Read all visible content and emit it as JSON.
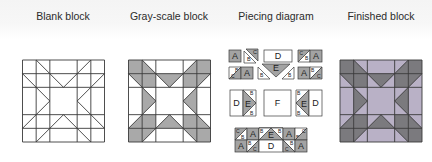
{
  "captions": {
    "blank": "Blank block",
    "grayscale": "Gray-scale block",
    "piecing": "Piecing diagram",
    "finished": "Finished block"
  },
  "colors": {
    "line": "#3a3a3a",
    "blank_fill": "#ffffff",
    "gray_dark": "#a9a9a9",
    "gray_light": "#ffffff",
    "finished_dark": "#7b7a7e",
    "finished_light": "#b9b1c6",
    "piece_dark": "#a3a3a3",
    "piece_light": "#ffffff"
  },
  "block_grid": {
    "units": 6,
    "lines": [
      0,
      1,
      2,
      4,
      5,
      6
    ],
    "diagonals": [
      [
        [
          1,
          0
        ],
        [
          3,
          2
        ]
      ],
      [
        [
          5,
          0
        ],
        [
          3,
          2
        ]
      ],
      [
        [
          0,
          1
        ],
        [
          2,
          3
        ]
      ],
      [
        [
          0,
          5
        ],
        [
          2,
          3
        ]
      ],
      [
        [
          6,
          1
        ],
        [
          4,
          3
        ]
      ],
      [
        [
          6,
          5
        ],
        [
          4,
          3
        ]
      ],
      [
        [
          1,
          6
        ],
        [
          3,
          4
        ]
      ],
      [
        [
          5,
          6
        ],
        [
          3,
          4
        ]
      ]
    ],
    "dark_shapes": [
      [
        [
          0,
          0
        ],
        [
          1,
          0
        ],
        [
          1,
          1
        ],
        [
          0,
          1
        ]
      ],
      [
        [
          5,
          0
        ],
        [
          6,
          0
        ],
        [
          6,
          1
        ],
        [
          5,
          1
        ]
      ],
      [
        [
          0,
          5
        ],
        [
          1,
          5
        ],
        [
          1,
          6
        ],
        [
          0,
          6
        ]
      ],
      [
        [
          5,
          5
        ],
        [
          6,
          5
        ],
        [
          6,
          6
        ],
        [
          5,
          6
        ]
      ],
      [
        [
          1,
          1
        ],
        [
          2,
          1
        ],
        [
          2,
          2
        ],
        [
          1,
          2
        ]
      ],
      [
        [
          4,
          1
        ],
        [
          5,
          1
        ],
        [
          5,
          2
        ],
        [
          4,
          2
        ]
      ],
      [
        [
          1,
          4
        ],
        [
          2,
          4
        ],
        [
          2,
          5
        ],
        [
          1,
          5
        ]
      ],
      [
        [
          4,
          4
        ],
        [
          5,
          4
        ],
        [
          5,
          5
        ],
        [
          4,
          5
        ]
      ],
      [
        [
          1,
          0
        ],
        [
          1,
          1
        ],
        [
          2,
          1
        ]
      ],
      [
        [
          5,
          0
        ],
        [
          5,
          1
        ],
        [
          4,
          1
        ]
      ],
      [
        [
          0,
          1
        ],
        [
          1,
          1
        ],
        [
          1,
          2
        ]
      ],
      [
        [
          6,
          1
        ],
        [
          5,
          1
        ],
        [
          5,
          2
        ]
      ],
      [
        [
          0,
          5
        ],
        [
          1,
          5
        ],
        [
          1,
          4
        ]
      ],
      [
        [
          6,
          5
        ],
        [
          5,
          5
        ],
        [
          5,
          4
        ]
      ],
      [
        [
          1,
          6
        ],
        [
          1,
          5
        ],
        [
          2,
          5
        ]
      ],
      [
        [
          5,
          6
        ],
        [
          5,
          5
        ],
        [
          4,
          5
        ]
      ],
      [
        [
          2,
          1
        ],
        [
          4,
          1
        ],
        [
          3,
          2
        ]
      ],
      [
        [
          2,
          5
        ],
        [
          4,
          5
        ],
        [
          3,
          4
        ]
      ],
      [
        [
          1,
          2
        ],
        [
          1,
          4
        ],
        [
          2,
          3
        ]
      ],
      [
        [
          5,
          2
        ],
        [
          5,
          4
        ],
        [
          4,
          3
        ]
      ]
    ]
  },
  "blocks": {
    "blank": {
      "x": 22.5,
      "y": 60,
      "size": 82
    },
    "grayscale": {
      "x": 128.5,
      "y": 60,
      "size": 82
    },
    "finished": {
      "x": 340,
      "y": 60,
      "size": 82
    }
  },
  "piecing": {
    "pieces": [
      {
        "shape": "rect",
        "x": 229,
        "y": 50,
        "w": 12,
        "h": 12,
        "fill": "dark",
        "label": "A"
      },
      {
        "shape": "poly",
        "pts": [
          [
            244,
            51
          ],
          [
            244,
            63
          ],
          [
            256,
            63
          ]
        ],
        "fill": "light",
        "label": "B",
        "lx": 247,
        "ly": 61,
        "fs": 5.5
      },
      {
        "shape": "poly",
        "pts": [
          [
            246,
            49
          ],
          [
            258,
            49
          ],
          [
            258,
            61
          ]
        ],
        "fill": "dark",
        "label": "C",
        "lx": 253,
        "ly": 54,
        "fs": 5.5
      },
      {
        "shape": "rect",
        "x": 264,
        "y": 50,
        "w": 28,
        "h": 12,
        "fill": "light",
        "label": "D"
      },
      {
        "shape": "poly",
        "pts": [
          [
            298,
            50
          ],
          [
            310,
            50
          ],
          [
            298,
            62
          ]
        ],
        "fill": "dark",
        "label": "C",
        "lx": 299.5,
        "ly": 55,
        "fs": 5
      },
      {
        "shape": "poly",
        "pts": [
          [
            310,
            50
          ],
          [
            310,
            62
          ],
          [
            298,
            62
          ]
        ],
        "fill": "light",
        "label": "B",
        "lx": 305,
        "ly": 60,
        "fs": 5
      },
      {
        "shape": "rect",
        "x": 310,
        "y": 50,
        "w": 12,
        "h": 12,
        "fill": "dark",
        "label": "A"
      },
      {
        "shape": "poly",
        "pts": [
          [
            229,
            67
          ],
          [
            241,
            67
          ],
          [
            229,
            79
          ]
        ],
        "fill": "light",
        "label": "B",
        "lx": 235,
        "ly": 72,
        "fs": 5
      },
      {
        "shape": "poly",
        "pts": [
          [
            241,
            67
          ],
          [
            241,
            79
          ],
          [
            229,
            79
          ]
        ],
        "fill": "dark",
        "label": "C",
        "lx": 231,
        "ly": 78,
        "fs": 5
      },
      {
        "shape": "rect",
        "x": 241,
        "y": 67,
        "w": 12,
        "h": 12,
        "fill": "dark",
        "label": "A"
      },
      {
        "shape": "poly",
        "pts": [
          [
            262,
            64
          ],
          [
            290,
            64
          ],
          [
            276,
            77
          ]
        ],
        "fill": "dark",
        "label": "E"
      },
      {
        "shape": "poly",
        "pts": [
          [
            258,
            67
          ],
          [
            258,
            79
          ],
          [
            270,
            79
          ]
        ],
        "fill": "light",
        "label": "B",
        "lx": 260,
        "ly": 77,
        "fs": 5
      },
      {
        "shape": "poly",
        "pts": [
          [
            294,
            67
          ],
          [
            294,
            79
          ],
          [
            282,
            79
          ]
        ],
        "fill": "light",
        "label": "B",
        "lx": 288,
        "ly": 77,
        "fs": 5
      },
      {
        "shape": "rect",
        "x": 298,
        "y": 67,
        "w": 12,
        "h": 12,
        "fill": "dark",
        "label": "A"
      },
      {
        "shape": "poly",
        "pts": [
          [
            310,
            67
          ],
          [
            322,
            67
          ],
          [
            310,
            79
          ]
        ],
        "fill": "light",
        "label": "B",
        "lx": 311,
        "ly": 72,
        "fs": 5
      },
      {
        "shape": "poly",
        "pts": [
          [
            322,
            67
          ],
          [
            322,
            79
          ],
          [
            310,
            79
          ]
        ],
        "fill": "dark",
        "label": "C",
        "lx": 317,
        "ly": 78,
        "fs": 5
      },
      {
        "shape": "rect",
        "x": 230,
        "y": 90,
        "w": 13,
        "h": 26,
        "fill": "light",
        "label": "D"
      },
      {
        "shape": "poly",
        "pts": [
          [
            243,
            90
          ],
          [
            243,
            116
          ],
          [
            256,
            103
          ]
        ],
        "fill": "dark",
        "label": "E",
        "lx": 245,
        "ly": 106.5
      },
      {
        "shape": "poly",
        "pts": [
          [
            243,
            90
          ],
          [
            256,
            90
          ],
          [
            256,
            103
          ]
        ],
        "fill": "light",
        "label": "B",
        "lx": 250,
        "ly": 95,
        "fs": 5
      },
      {
        "shape": "poly",
        "pts": [
          [
            243,
            116
          ],
          [
            256,
            116
          ],
          [
            256,
            103
          ]
        ],
        "fill": "light",
        "label": "B",
        "lx": 250,
        "ly": 115,
        "fs": 5
      },
      {
        "shape": "rect",
        "x": 264,
        "y": 90,
        "w": 27,
        "h": 26,
        "fill": "light",
        "label": "F"
      },
      {
        "shape": "poly",
        "pts": [
          [
            309,
            90
          ],
          [
            309,
            116
          ],
          [
            296,
            103
          ]
        ],
        "fill": "dark",
        "label": "E",
        "lx": 301,
        "ly": 106.5
      },
      {
        "shape": "poly",
        "pts": [
          [
            296,
            90
          ],
          [
            309,
            90
          ],
          [
            296,
            103
          ]
        ],
        "fill": "light",
        "label": "B",
        "lx": 297,
        "ly": 95,
        "fs": 5
      },
      {
        "shape": "poly",
        "pts": [
          [
            296,
            116
          ],
          [
            309,
            116
          ],
          [
            296,
            103
          ]
        ],
        "fill": "light",
        "label": "B",
        "lx": 297,
        "ly": 115,
        "fs": 5
      },
      {
        "shape": "rect",
        "x": 309,
        "y": 90,
        "w": 13,
        "h": 26,
        "fill": "light",
        "label": "D"
      },
      {
        "shape": "poly",
        "pts": [
          [
            235,
            128
          ],
          [
            247,
            128
          ],
          [
            235,
            140
          ]
        ],
        "fill": "dark",
        "label": "C",
        "lx": 236,
        "ly": 133,
        "fs": 5
      },
      {
        "shape": "poly",
        "pts": [
          [
            247,
            128
          ],
          [
            247,
            140
          ],
          [
            235,
            140
          ]
        ],
        "fill": "light",
        "label": "B",
        "lx": 241,
        "ly": 139,
        "fs": 5
      },
      {
        "shape": "rect",
        "x": 247,
        "y": 128,
        "w": 12,
        "h": 12,
        "fill": "dark",
        "label": "A"
      },
      {
        "shape": "poly",
        "pts": [
          [
            259,
            128
          ],
          [
            259,
            140
          ],
          [
            271,
            140
          ]
        ],
        "fill": "light",
        "label": "B",
        "lx": 260,
        "ly": 134,
        "fs": 5
      },
      {
        "shape": "poly",
        "pts": [
          [
            259,
            128
          ],
          [
            271,
            140
          ],
          [
            283,
            128
          ],
          [
            271,
            128
          ]
        ],
        "fill": "light"
      },
      {
        "shape": "poly",
        "pts": [
          [
            259,
            128
          ],
          [
            283,
            128
          ],
          [
            271,
            140
          ]
        ],
        "fill": "light"
      },
      {
        "shape": "poly",
        "pts": [
          [
            271,
            128
          ],
          [
            259,
            140
          ],
          [
            283,
            140
          ]
        ],
        "fill": "dark",
        "label": "E",
        "lx": 268,
        "ly": 138
      },
      {
        "shape": "poly",
        "pts": [
          [
            259,
            128
          ],
          [
            271,
            128
          ],
          [
            259,
            140
          ]
        ],
        "fill": "light",
        "label": "B",
        "lx": 260,
        "ly": 133,
        "fs": 5
      },
      {
        "shape": "poly",
        "pts": [
          [
            271,
            128
          ],
          [
            283,
            128
          ],
          [
            283,
            140
          ]
        ],
        "fill": "light",
        "label": "B",
        "lx": 278,
        "ly": 133,
        "fs": 5
      },
      {
        "shape": "rect",
        "x": 283,
        "y": 128,
        "w": 12,
        "h": 12,
        "fill": "dark",
        "label": "A"
      },
      {
        "shape": "poly",
        "pts": [
          [
            295,
            128
          ],
          [
            307,
            128
          ],
          [
            295,
            140
          ]
        ],
        "fill": "light",
        "label": "B",
        "lx": 296,
        "ly": 139,
        "fs": 5
      },
      {
        "shape": "poly",
        "pts": [
          [
            307,
            128
          ],
          [
            307,
            140
          ],
          [
            295,
            140
          ]
        ],
        "fill": "dark",
        "label": "C",
        "lx": 302,
        "ly": 133,
        "fs": 5
      },
      {
        "shape": "rect",
        "x": 235,
        "y": 140,
        "w": 12,
        "h": 12,
        "fill": "dark",
        "label": "A"
      },
      {
        "shape": "poly",
        "pts": [
          [
            247,
            140
          ],
          [
            259,
            140
          ],
          [
            247,
            152
          ]
        ],
        "fill": "light",
        "label": "B",
        "lx": 248,
        "ly": 145,
        "fs": 5
      },
      {
        "shape": "poly",
        "pts": [
          [
            259,
            140
          ],
          [
            259,
            152
          ],
          [
            247,
            152
          ]
        ],
        "fill": "dark",
        "label": "C",
        "lx": 253,
        "ly": 151,
        "fs": 5
      },
      {
        "shape": "rect",
        "x": 259,
        "y": 140,
        "w": 24,
        "h": 12,
        "fill": "light",
        "label": "D"
      },
      {
        "shape": "poly",
        "pts": [
          [
            283,
            140
          ],
          [
            295,
            140
          ],
          [
            295,
            152
          ]
        ],
        "fill": "light",
        "label": "B",
        "lx": 290,
        "ly": 145,
        "fs": 5
      },
      {
        "shape": "poly",
        "pts": [
          [
            283,
            140
          ],
          [
            283,
            152
          ],
          [
            295,
            152
          ]
        ],
        "fill": "dark",
        "label": "C",
        "lx": 285,
        "ly": 151,
        "fs": 5
      },
      {
        "shape": "rect",
        "x": 295,
        "y": 140,
        "w": 12,
        "h": 12,
        "fill": "dark",
        "label": "A"
      }
    ]
  }
}
